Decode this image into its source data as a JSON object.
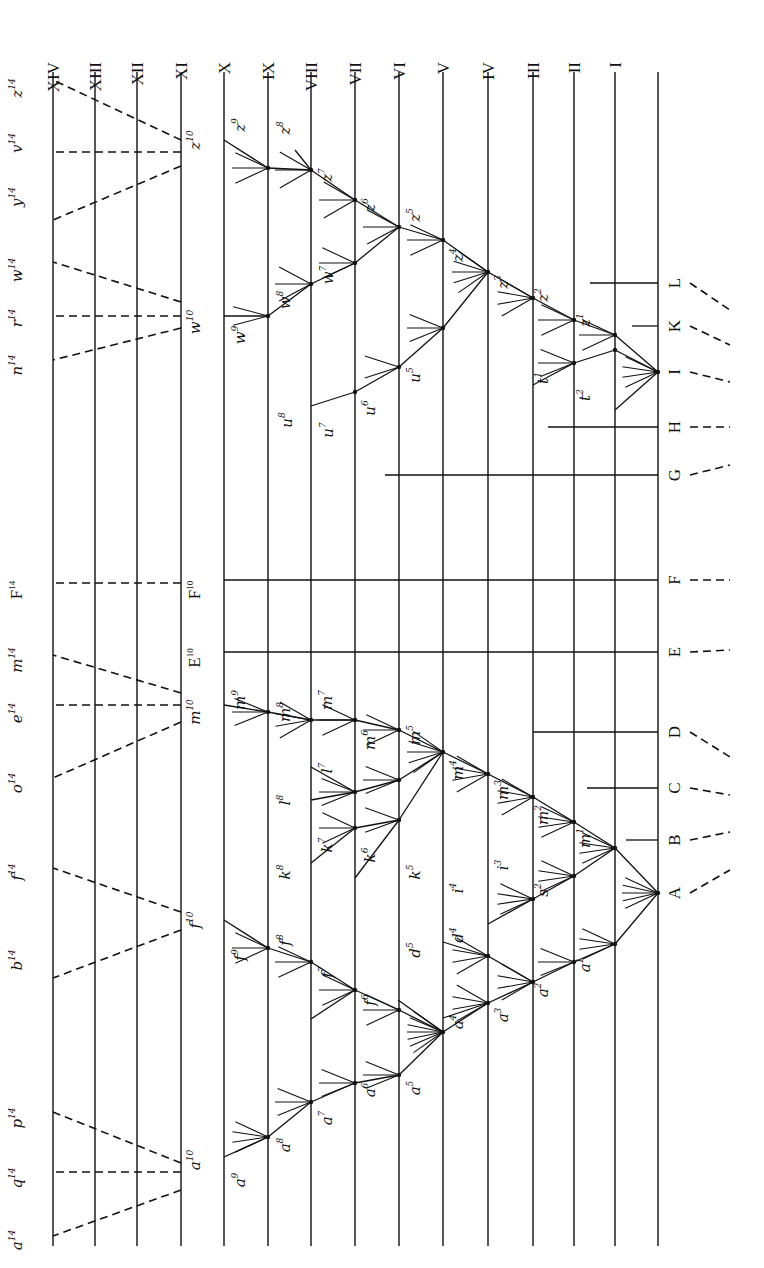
{
  "figure": {
    "orientation": "rotated-90-clockwise",
    "ink_color": "#111111",
    "paper_color": "#ffffff"
  },
  "generations": [
    {
      "label": "XIV",
      "x": 53
    },
    {
      "label": "XIII",
      "x": 95
    },
    {
      "label": "XII",
      "x": 137
    },
    {
      "label": "XI",
      "x": 181
    },
    {
      "label": "X",
      "x": 224
    },
    {
      "label": "IX",
      "x": 268
    },
    {
      "label": "VIII",
      "x": 311
    },
    {
      "label": "VII",
      "x": 355
    },
    {
      "label": "VI",
      "x": 399
    },
    {
      "label": "V",
      "x": 443
    },
    {
      "label": "IV",
      "x": 488
    },
    {
      "label": "III",
      "x": 533
    },
    {
      "label": "II",
      "x": 574
    },
    {
      "label": "I",
      "x": 615
    },
    {
      "label": "",
      "x": 658
    }
  ],
  "line_extent": {
    "top": 72,
    "bottom": 1246
  },
  "ancestral_species": [
    {
      "label": "L",
      "y": 283,
      "dash_to": [
        730,
        310
      ]
    },
    {
      "label": "K",
      "y": 326,
      "dash_to": [
        730,
        345
      ]
    },
    {
      "label": "I",
      "y": 372,
      "dash_to": [
        730,
        382
      ]
    },
    {
      "label": "H",
      "y": 427,
      "dash_to": [
        730,
        427
      ]
    },
    {
      "label": "G",
      "y": 475,
      "dash_to": [
        730,
        465
      ]
    },
    {
      "label": "F",
      "y": 580,
      "dash_to": [
        730,
        580
      ]
    },
    {
      "label": "E",
      "y": 652,
      "dash_to": [
        730,
        650
      ]
    },
    {
      "label": "D",
      "y": 732,
      "dash_to": [
        730,
        757
      ]
    },
    {
      "label": "C",
      "y": 788,
      "dash_to": [
        730,
        795
      ]
    },
    {
      "label": "B",
      "y": 840,
      "dash_to": [
        730,
        832
      ]
    },
    {
      "label": "A",
      "y": 893,
      "dash_to": [
        730,
        870
      ]
    }
  ],
  "persistent_lines": [
    {
      "name": "L",
      "x1": 590,
      "y1": 283,
      "x2": 658,
      "y2": 283
    },
    {
      "name": "K",
      "x1": 632,
      "y1": 326,
      "x2": 658,
      "y2": 326
    },
    {
      "name": "H",
      "x1": 548,
      "y1": 427,
      "x2": 658,
      "y2": 427
    },
    {
      "name": "G",
      "x1": 385,
      "y1": 475,
      "x2": 658,
      "y2": 475
    },
    {
      "name": "F",
      "x1": 224,
      "y1": 580,
      "x2": 658,
      "y2": 580
    },
    {
      "name": "E",
      "x1": 224,
      "y1": 652,
      "x2": 658,
      "y2": 652
    },
    {
      "name": "D",
      "x1": 533,
      "y1": 732,
      "x2": 658,
      "y2": 732
    },
    {
      "name": "C",
      "x1": 587,
      "y1": 788,
      "x2": 658,
      "y2": 788
    },
    {
      "name": "B",
      "x1": 626,
      "y1": 840,
      "x2": 658,
      "y2": 840
    }
  ],
  "branches": [
    [
      658,
      372,
      615,
      335
    ],
    [
      615,
      335,
      574,
      320
    ],
    [
      574,
      320,
      533,
      298
    ],
    [
      533,
      298,
      488,
      272
    ],
    [
      488,
      272,
      443,
      240
    ],
    [
      443,
      240,
      399,
      227
    ],
    [
      399,
      227,
      355,
      200
    ],
    [
      355,
      200,
      311,
      170
    ],
    [
      311,
      170,
      268,
      168
    ],
    [
      268,
      168,
      224,
      140
    ],
    [
      311,
      170,
      295,
      150
    ],
    [
      658,
      372,
      615,
      350
    ],
    [
      615,
      350,
      574,
      363
    ],
    [
      574,
      363,
      533,
      385
    ],
    [
      658,
      372,
      615,
      410
    ],
    [
      488,
      272,
      443,
      328
    ],
    [
      443,
      328,
      399,
      367
    ],
    [
      399,
      367,
      355,
      392
    ],
    [
      355,
      392,
      311,
      406
    ],
    [
      399,
      227,
      355,
      263
    ],
    [
      355,
      263,
      311,
      284
    ],
    [
      311,
      284,
      268,
      316
    ],
    [
      268,
      316,
      224,
      316
    ],
    [
      658,
      893,
      615,
      848
    ],
    [
      615,
      848,
      574,
      822
    ],
    [
      574,
      822,
      533,
      797
    ],
    [
      533,
      797,
      488,
      774
    ],
    [
      488,
      774,
      443,
      752
    ],
    [
      443,
      752,
      399,
      730
    ],
    [
      399,
      730,
      355,
      720
    ],
    [
      355,
      720,
      311,
      720
    ],
    [
      311,
      720,
      268,
      712
    ],
    [
      268,
      712,
      224,
      705
    ],
    [
      443,
      752,
      399,
      780
    ],
    [
      399,
      780,
      355,
      792
    ],
    [
      355,
      792,
      311,
      800
    ],
    [
      355,
      792,
      311,
      767
    ],
    [
      399,
      820,
      355,
      828
    ],
    [
      355,
      828,
      311,
      863
    ],
    [
      399,
      820,
      355,
      878
    ],
    [
      443,
      752,
      399,
      820
    ],
    [
      615,
      848,
      574,
      876
    ],
    [
      574,
      876,
      533,
      899
    ],
    [
      533,
      899,
      488,
      924
    ],
    [
      658,
      893,
      615,
      944
    ],
    [
      615,
      944,
      574,
      962
    ],
    [
      574,
      962,
      533,
      982
    ],
    [
      533,
      982,
      488,
      1003
    ],
    [
      488,
      1003,
      443,
      1032
    ],
    [
      443,
      1032,
      399,
      1010
    ],
    [
      399,
      1010,
      355,
      990
    ],
    [
      355,
      990,
      311,
      962
    ],
    [
      311,
      962,
      268,
      948
    ],
    [
      268,
      948,
      224,
      920
    ],
    [
      355,
      990,
      311,
      1019
    ],
    [
      443,
      1032,
      399,
      1075
    ],
    [
      399,
      1075,
      355,
      1083
    ],
    [
      355,
      1083,
      311,
      1102
    ],
    [
      311,
      1102,
      268,
      1137
    ],
    [
      268,
      1137,
      224,
      1157
    ],
    [
      443,
      1032,
      398,
      1000
    ],
    [
      533,
      982,
      488,
      956
    ],
    [
      488,
      956,
      443,
      942
    ],
    [
      488,
      1003,
      443,
      1018
    ]
  ],
  "nodes": [
    [
      658,
      372
    ],
    [
      615,
      335
    ],
    [
      574,
      320
    ],
    [
      533,
      298
    ],
    [
      488,
      272
    ],
    [
      443,
      240
    ],
    [
      399,
      227
    ],
    [
      355,
      200
    ],
    [
      311,
      170
    ],
    [
      268,
      168
    ],
    [
      615,
      350
    ],
    [
      574,
      363
    ],
    [
      443,
      328
    ],
    [
      399,
      367
    ],
    [
      355,
      392
    ],
    [
      355,
      263
    ],
    [
      311,
      284
    ],
    [
      268,
      316
    ],
    [
      658,
      893
    ],
    [
      615,
      848
    ],
    [
      574,
      822
    ],
    [
      533,
      797
    ],
    [
      488,
      774
    ],
    [
      443,
      752
    ],
    [
      399,
      730
    ],
    [
      355,
      720
    ],
    [
      311,
      720
    ],
    [
      268,
      712
    ],
    [
      399,
      780
    ],
    [
      355,
      792
    ],
    [
      399,
      820
    ],
    [
      355,
      828
    ],
    [
      574,
      876
    ],
    [
      533,
      899
    ],
    [
      615,
      944
    ],
    [
      574,
      962
    ],
    [
      533,
      982
    ],
    [
      488,
      1003
    ],
    [
      443,
      1032
    ],
    [
      399,
      1010
    ],
    [
      355,
      990
    ],
    [
      311,
      962
    ],
    [
      268,
      948
    ],
    [
      399,
      1075
    ],
    [
      355,
      1083
    ],
    [
      311,
      1102
    ],
    [
      268,
      1137
    ],
    [
      488,
      956
    ]
  ],
  "twig_fans": [
    {
      "x": 658,
      "y": 372,
      "n": 4,
      "spread": 25
    },
    {
      "x": 615,
      "y": 335,
      "n": 3,
      "spread": 25
    },
    {
      "x": 574,
      "y": 320,
      "n": 3,
      "spread": 25
    },
    {
      "x": 533,
      "y": 298,
      "n": 4,
      "spread": 30
    },
    {
      "x": 488,
      "y": 272,
      "n": 5,
      "spread": 35
    },
    {
      "x": 443,
      "y": 240,
      "n": 3,
      "spread": 25
    },
    {
      "x": 399,
      "y": 227,
      "n": 3,
      "spread": 28
    },
    {
      "x": 355,
      "y": 200,
      "n": 3,
      "spread": 30
    },
    {
      "x": 311,
      "y": 170,
      "n": 3,
      "spread": 30
    },
    {
      "x": 268,
      "y": 168,
      "n": 3,
      "spread": 25
    },
    {
      "x": 574,
      "y": 363,
      "n": 3,
      "spread": 22
    },
    {
      "x": 443,
      "y": 328,
      "n": 3,
      "spread": 22
    },
    {
      "x": 399,
      "y": 367,
      "n": 2,
      "spread": 18
    },
    {
      "x": 355,
      "y": 263,
      "n": 3,
      "spread": 25
    },
    {
      "x": 311,
      "y": 284,
      "n": 3,
      "spread": 28
    },
    {
      "x": 268,
      "y": 316,
      "n": 2,
      "spread": 15
    },
    {
      "x": 658,
      "y": 893,
      "n": 5,
      "spread": 25
    },
    {
      "x": 615,
      "y": 848,
      "n": 4,
      "spread": 25
    },
    {
      "x": 574,
      "y": 822,
      "n": 4,
      "spread": 25
    },
    {
      "x": 533,
      "y": 797,
      "n": 4,
      "spread": 30
    },
    {
      "x": 488,
      "y": 774,
      "n": 4,
      "spread": 30
    },
    {
      "x": 443,
      "y": 752,
      "n": 5,
      "spread": 35
    },
    {
      "x": 399,
      "y": 730,
      "n": 3,
      "spread": 25
    },
    {
      "x": 355,
      "y": 720,
      "n": 3,
      "spread": 25
    },
    {
      "x": 311,
      "y": 720,
      "n": 4,
      "spread": 30
    },
    {
      "x": 268,
      "y": 712,
      "n": 3,
      "spread": 22
    },
    {
      "x": 399,
      "y": 780,
      "n": 3,
      "spread": 22
    },
    {
      "x": 355,
      "y": 792,
      "n": 3,
      "spread": 22
    },
    {
      "x": 399,
      "y": 820,
      "n": 2,
      "spread": 20
    },
    {
      "x": 355,
      "y": 828,
      "n": 3,
      "spread": 25
    },
    {
      "x": 574,
      "y": 876,
      "n": 4,
      "spread": 25
    },
    {
      "x": 533,
      "y": 899,
      "n": 4,
      "spread": 25
    },
    {
      "x": 615,
      "y": 944,
      "n": 4,
      "spread": 25
    },
    {
      "x": 574,
      "y": 962,
      "n": 3,
      "spread": 22
    },
    {
      "x": 533,
      "y": 982,
      "n": 4,
      "spread": 30
    },
    {
      "x": 488,
      "y": 1003,
      "n": 4,
      "spread": 30
    },
    {
      "x": 443,
      "y": 1032,
      "n": 7,
      "spread": 35
    },
    {
      "x": 399,
      "y": 1010,
      "n": 3,
      "spread": 25
    },
    {
      "x": 355,
      "y": 990,
      "n": 3,
      "spread": 25
    },
    {
      "x": 311,
      "y": 962,
      "n": 3,
      "spread": 25
    },
    {
      "x": 268,
      "y": 948,
      "n": 3,
      "spread": 25
    },
    {
      "x": 488,
      "y": 956,
      "n": 4,
      "spread": 30
    },
    {
      "x": 399,
      "y": 1075,
      "n": 3,
      "spread": 22
    },
    {
      "x": 355,
      "y": 1083,
      "n": 3,
      "spread": 22
    },
    {
      "x": 311,
      "y": 1102,
      "n": 3,
      "spread": 22
    },
    {
      "x": 268,
      "y": 1137,
      "n": 4,
      "spread": 25
    }
  ],
  "dashed_descents": [
    [
      181,
      140,
      53,
      80
    ],
    [
      181,
      152,
      53,
      152
    ],
    [
      181,
      166,
      53,
      220
    ],
    [
      181,
      302,
      53,
      262
    ],
    [
      181,
      316,
      53,
      316
    ],
    [
      181,
      328,
      53,
      360
    ],
    [
      181,
      583,
      53,
      583
    ],
    [
      181,
      693,
      53,
      655
    ],
    [
      181,
      705,
      53,
      705
    ],
    [
      181,
      722,
      53,
      778
    ],
    [
      181,
      912,
      53,
      868
    ],
    [
      181,
      930,
      53,
      978
    ],
    [
      181,
      1163,
      53,
      1112
    ],
    [
      181,
      1172,
      53,
      1172
    ],
    [
      181,
      1190,
      53,
      1236
    ]
  ],
  "species_labels": [
    {
      "base": "z",
      "sup": "14",
      "x": 22,
      "y": 88
    },
    {
      "base": "v",
      "sup": "14",
      "x": 22,
      "y": 143
    },
    {
      "base": "y",
      "sup": "14",
      "x": 22,
      "y": 197
    },
    {
      "base": "w",
      "sup": "14",
      "x": 22,
      "y": 270
    },
    {
      "base": "r",
      "sup": "14",
      "x": 22,
      "y": 318
    },
    {
      "base": "n",
      "sup": "14",
      "x": 22,
      "y": 365
    },
    {
      "base": "F",
      "sup": "14",
      "x": 22,
      "y": 590,
      "roman": true
    },
    {
      "base": "m",
      "sup": "14",
      "x": 22,
      "y": 660
    },
    {
      "base": "e",
      "sup": "14",
      "x": 22,
      "y": 713
    },
    {
      "base": "o",
      "sup": "14",
      "x": 22,
      "y": 783
    },
    {
      "base": "f",
      "sup": "14",
      "x": 22,
      "y": 872
    },
    {
      "base": "b",
      "sup": "14",
      "x": 22,
      "y": 960
    },
    {
      "base": "p",
      "sup": "14",
      "x": 22,
      "y": 1118
    },
    {
      "base": "q",
      "sup": "14",
      "x": 22,
      "y": 1178
    },
    {
      "base": "a",
      "sup": "14",
      "x": 22,
      "y": 1240
    },
    {
      "base": "z",
      "sup": "10",
      "x": 200,
      "y": 140
    },
    {
      "base": "w",
      "sup": "10",
      "x": 200,
      "y": 322
    },
    {
      "base": "F",
      "sup": "10",
      "x": 200,
      "y": 590,
      "roman": true
    },
    {
      "base": "E",
      "sup": "10",
      "x": 200,
      "y": 658,
      "roman": true
    },
    {
      "base": "m",
      "sup": "10",
      "x": 200,
      "y": 712
    },
    {
      "base": "f",
      "sup": "10",
      "x": 200,
      "y": 920
    },
    {
      "base": "a",
      "sup": "10",
      "x": 200,
      "y": 1160
    },
    {
      "base": "z",
      "sup": "9",
      "x": 245,
      "y": 125
    },
    {
      "base": "z",
      "sup": "8",
      "x": 290,
      "y": 128
    },
    {
      "base": "z",
      "sup": "7",
      "x": 332,
      "y": 175
    },
    {
      "base": "z",
      "sup": "6",
      "x": 375,
      "y": 205
    },
    {
      "base": "z",
      "sup": "5",
      "x": 420,
      "y": 215
    },
    {
      "base": "z",
      "sup": "4",
      "x": 463,
      "y": 255
    },
    {
      "base": "z",
      "sup": "3",
      "x": 508,
      "y": 282
    },
    {
      "base": "z",
      "sup": "2",
      "x": 548,
      "y": 295
    },
    {
      "base": "z",
      "sup": "1",
      "x": 590,
      "y": 320
    },
    {
      "base": "w",
      "sup": "9",
      "x": 245,
      "y": 335
    },
    {
      "base": "w",
      "sup": "8",
      "x": 290,
      "y": 300
    },
    {
      "base": "w",
      "sup": "7",
      "x": 333,
      "y": 275
    },
    {
      "base": "u",
      "sup": "8",
      "x": 292,
      "y": 420
    },
    {
      "base": "u",
      "sup": "7",
      "x": 333,
      "y": 430
    },
    {
      "base": "u",
      "sup": "6",
      "x": 375,
      "y": 408
    },
    {
      "base": "u",
      "sup": "5",
      "x": 420,
      "y": 375
    },
    {
      "base": "t",
      "sup": "1",
      "x": 548,
      "y": 378
    },
    {
      "base": "t",
      "sup": "2",
      "x": 590,
      "y": 395
    },
    {
      "base": "m",
      "sup": "9",
      "x": 245,
      "y": 700
    },
    {
      "base": "m",
      "sup": "8",
      "x": 290,
      "y": 712
    },
    {
      "base": "m",
      "sup": "7",
      "x": 332,
      "y": 700
    },
    {
      "base": "m",
      "sup": "6",
      "x": 375,
      "y": 740
    },
    {
      "base": "m",
      "sup": "5",
      "x": 420,
      "y": 735
    },
    {
      "base": "m",
      "sup": "4",
      "x": 463,
      "y": 770
    },
    {
      "base": "m",
      "sup": "3",
      "x": 508,
      "y": 790
    },
    {
      "base": "m",
      "sup": "2",
      "x": 548,
      "y": 815
    },
    {
      "base": "m",
      "sup": "1",
      "x": 590,
      "y": 838
    },
    {
      "base": "l",
      "sup": "8",
      "x": 290,
      "y": 800
    },
    {
      "base": "l",
      "sup": "7",
      "x": 332,
      "y": 768
    },
    {
      "base": "k",
      "sup": "8",
      "x": 290,
      "y": 872
    },
    {
      "base": "k",
      "sup": "7",
      "x": 332,
      "y": 845
    },
    {
      "base": "k",
      "sup": "6",
      "x": 375,
      "y": 855
    },
    {
      "base": "k",
      "sup": "5",
      "x": 420,
      "y": 872
    },
    {
      "base": "i",
      "sup": "4",
      "x": 463,
      "y": 888
    },
    {
      "base": "i",
      "sup": "3",
      "x": 508,
      "y": 865
    },
    {
      "base": "s",
      "sup": "2",
      "x": 548,
      "y": 890
    },
    {
      "base": "f",
      "sup": "9",
      "x": 245,
      "y": 955
    },
    {
      "base": "f",
      "sup": "8",
      "x": 290,
      "y": 940
    },
    {
      "base": "f",
      "sup": "7",
      "x": 332,
      "y": 972
    },
    {
      "base": "f",
      "sup": "6",
      "x": 375,
      "y": 1000
    },
    {
      "base": "d",
      "sup": "5",
      "x": 420,
      "y": 950
    },
    {
      "base": "d",
      "sup": "4",
      "x": 463,
      "y": 935
    },
    {
      "base": "a",
      "sup": "4",
      "x": 463,
      "y": 1022
    },
    {
      "base": "a",
      "sup": "3",
      "x": 508,
      "y": 1015
    },
    {
      "base": "a",
      "sup": "2",
      "x": 548,
      "y": 990
    },
    {
      "base": "a",
      "sup": "1",
      "x": 590,
      "y": 965
    },
    {
      "base": "a",
      "sup": "5",
      "x": 420,
      "y": 1088
    },
    {
      "base": "a",
      "sup": "6",
      "x": 375,
      "y": 1090
    },
    {
      "base": "a",
      "sup": "7",
      "x": 332,
      "y": 1118
    },
    {
      "base": "a",
      "sup": "8",
      "x": 290,
      "y": 1145
    },
    {
      "base": "a",
      "sup": "9",
      "x": 245,
      "y": 1180
    }
  ]
}
